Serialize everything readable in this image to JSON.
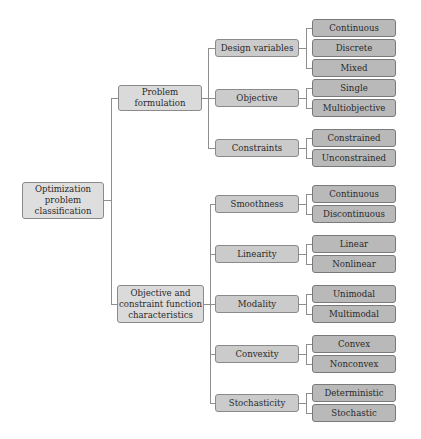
{
  "diagram": {
    "type": "tree",
    "title": "Optimization problem classification",
    "colors": {
      "root": "#dedede",
      "level1": "#dadada",
      "level2": "#cbcbcb",
      "leaf": "#b9b9b9",
      "connector": "#8e8e8e"
    },
    "root": {
      "label": "Optimization\nproblem\nclassification",
      "children": [
        {
          "label": "Problem\nformulation",
          "children": [
            {
              "label": "Design variables",
              "children": [
                "Continuous",
                "Discrete",
                "Mixed"
              ]
            },
            {
              "label": "Objective",
              "children": [
                "Single",
                "Multiobjective"
              ]
            },
            {
              "label": "Constraints",
              "children": [
                "Constrained",
                "Unconstrained"
              ]
            }
          ]
        },
        {
          "label": "Objective and\nconstraint function\ncharacteristics",
          "children": [
            {
              "label": "Smoothness",
              "children": [
                "Continuous",
                "Discontinuous"
              ]
            },
            {
              "label": "Linearity",
              "children": [
                "Linear",
                "Nonlinear"
              ]
            },
            {
              "label": "Modality",
              "children": [
                "Unimodal",
                "Multimodal"
              ]
            },
            {
              "label": "Convexity",
              "children": [
                "Convex",
                "Nonconvex"
              ]
            },
            {
              "label": "Stochasticity",
              "children": [
                "Deterministic",
                "Stochastic"
              ]
            }
          ]
        }
      ]
    }
  },
  "nodes": {
    "root": "Optimization\nproblem\nclassification",
    "problem_formulation": "Problem\nformulation",
    "obj_constraint_chars": "Objective and\nconstraint function\ncharacteristics",
    "design_variables": "Design variables",
    "dv_continuous": "Continuous",
    "dv_discrete": "Discrete",
    "dv_mixed": "Mixed",
    "objective": "Objective",
    "obj_single": "Single",
    "obj_multi": "Multiobjective",
    "constraints": "Constraints",
    "con_constrained": "Constrained",
    "con_unconstrained": "Unconstrained",
    "smoothness": "Smoothness",
    "sm_continuous": "Continuous",
    "sm_discontinuous": "Discontinuous",
    "linearity": "Linearity",
    "lin_linear": "Linear",
    "lin_nonlinear": "Nonlinear",
    "modality": "Modality",
    "mod_unimodal": "Unimodal",
    "mod_multimodal": "Multimodal",
    "convexity": "Convexity",
    "cvx_convex": "Convex",
    "cvx_nonconvex": "Nonconvex",
    "stochasticity": "Stochasticity",
    "sto_deterministic": "Deterministic",
    "sto_stochastic": "Stochastic"
  }
}
